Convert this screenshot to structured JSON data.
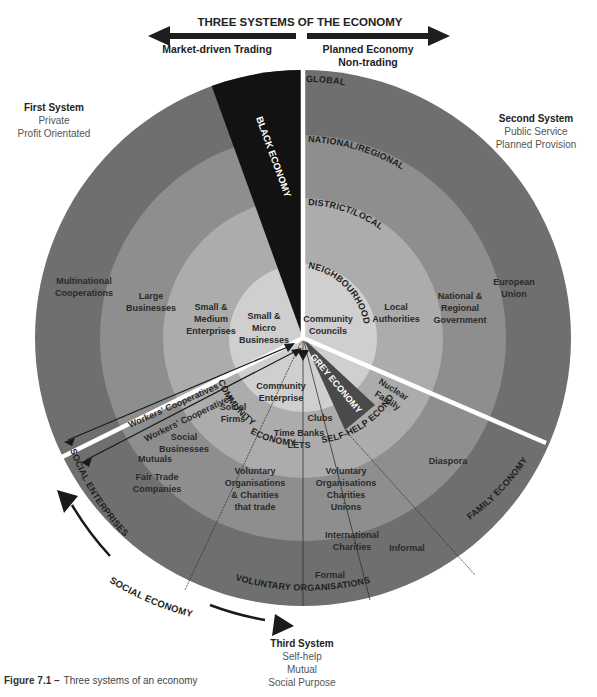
{
  "header": {
    "title": "THREE SYSTEMS OF THE ECONOMY",
    "left_label": "Market-driven Trading",
    "right_label_line1": "Planned Economy",
    "right_label_line2": "Non-trading"
  },
  "systems": {
    "first": {
      "title": "First System",
      "line1": "Private",
      "line2": "Profit Orientated"
    },
    "second": {
      "title": "Second System",
      "line1": "Public Service",
      "line2": "Planned Provision"
    },
    "third": {
      "title": "Third System",
      "line1": "Self-help",
      "line2": "Mutual",
      "line3": "Social Purpose"
    }
  },
  "rings": {
    "global": "GLOBAL",
    "national": "NATIONAL/REGIONAL",
    "district": "DISTRICT/LOCAL",
    "neighbourhood": "NEIGHBOURHOOD"
  },
  "first_system_items": {
    "multinational_1": "Multinational",
    "multinational_2": "Cooperations",
    "large_1": "Large",
    "large_2": "Businesses",
    "sme_1": "Small &",
    "sme_2": "Medium",
    "sme_3": "Enterprises",
    "micro_1": "Small &",
    "micro_2": "Micro",
    "micro_3": "Businesses"
  },
  "second_system_items": {
    "eu_1": "European",
    "eu_2": "Union",
    "nrg_1": "National &",
    "nrg_2": "Regional",
    "nrg_3": "Government",
    "la_1": "Local",
    "la_2": "Authorities",
    "cc_1": "Community",
    "cc_2": "Councils"
  },
  "wedges": {
    "black": "BLACK ECONOMY",
    "grey": "GREY ECONOMY",
    "self_help": "SELF-HELP ECONOMY",
    "community": "COMMUNITY",
    "community_economy": "ECONOMY",
    "family": "FAMILY ECONOMY",
    "social_enterprises": "SOCIAL ENTERPRISES",
    "voluntary_orgs": "VOLUNTARY ORGANISATIONS"
  },
  "third_system_items": {
    "workers_coop_outer": "Workers' Cooperatives",
    "workers_coop_inner": "Workers' Cooperatives",
    "community_enterprise_1": "Community",
    "community_enterprise_2": "Enterprise",
    "social_firms_1": "Social",
    "social_firms_2": "Firms",
    "clubs": "Clubs",
    "time_banks": "Time Banks",
    "lets": "LETS",
    "nuclear_family_1": "Nuclear",
    "nuclear_family_2": "Family",
    "social_businesses_1": "Social",
    "social_businesses_2": "Businesses",
    "mutuals": "Mutuals",
    "fair_trade_1": "Fair Trade",
    "fair_trade_2": "Companies",
    "vo_trade_1": "Voluntary",
    "vo_trade_2": "Organisations",
    "vo_trade_3": "& Charities",
    "vo_trade_4": "that trade",
    "vo_1": "Voluntary",
    "vo_2": "Organisations",
    "vo_3": "Charities",
    "vo_4": "Unions",
    "diaspora": "Diaspora",
    "intl_charities_1": "International",
    "intl_charities_2": "Charities",
    "informal": "Informal",
    "formal": "Formal"
  },
  "arc_arrow_label": "SOCIAL ECONOMY",
  "caption": {
    "bold": "Figure 7.1 –",
    "text": "Three systems of an economy"
  },
  "colors": {
    "ring_outer": "#6e6e6e",
    "ring_2": "#8c8c8c",
    "ring_3": "#aaaaaa",
    "ring_inner": "#cdcdcd",
    "black_wedge": "#111111",
    "grey_wedge": "#4a4a4a",
    "divider": "#ffffff"
  }
}
